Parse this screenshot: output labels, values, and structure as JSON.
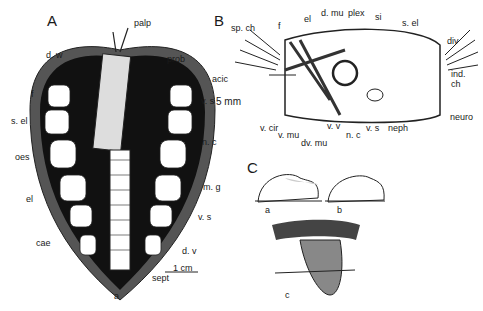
{
  "figure": {
    "panels": {
      "A": "A",
      "B": "B",
      "C": "C"
    },
    "panel_A_labels": {
      "palp": "palp",
      "prob": "prob",
      "d_w": "d. w",
      "f": "f",
      "s_el": "s. el",
      "oes": "oes",
      "el": "el",
      "cae": "cae",
      "v_s_top": "v. s",
      "n_c": "n. c",
      "m_g": "m. g",
      "v_s_bottom": "v. s",
      "d_v": "d. v",
      "sept": "sept",
      "a": "a",
      "scale": "1 cm"
    },
    "panel_B_labels": {
      "sp_ch": "sp. ch",
      "f": "f",
      "el": "el",
      "d_mu": "d. mu",
      "plex": "plex",
      "si": "si",
      "s_el": "s. el",
      "div": "div",
      "ind_ch": "ind.\nch",
      "acic": "acic",
      "scale": "5 mm",
      "neuro": "neuro",
      "v_cir": "v. cir",
      "v_mu": "v. mu",
      "dv_mu": "dv. mu",
      "v_v": "v. v",
      "n_c": "n. c",
      "v_s": "v. s",
      "neph": "neph"
    },
    "panel_C_labels": {
      "a": "a",
      "b": "b",
      "c": "c"
    }
  }
}
